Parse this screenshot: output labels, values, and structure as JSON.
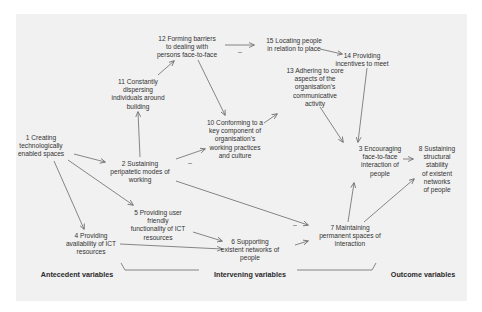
{
  "nodes": {
    "n1": "1 Creating\ntechnologically\nenabled spaces",
    "n2": "2 Sustaining\nperipatetic modes of\nworking",
    "n3": "3 Encouraging\nface-to-face\ninteraction of\npeople",
    "n4": "4 Providing\navailability of ICT\nresources",
    "n5": "5 Providing user\nfriendly\nfunctionality of ICT\nresources",
    "n6": "6 Supporting\nexistent networks of\npeople",
    "n7": "7 Maintaining\npermanent spaces of\ninteraction",
    "n8": "8 Sustaining\nstructural stability\nof existent networks\nof people",
    "n10": "10 Conforming to a\nkey component of\norganisation's\nworking practices\nand culture",
    "n11": "11 Constantly\ndispersing\nindividuals around\nbuilding",
    "n12": "12 Forming barriers\nto dealing with\npersons face-to-face",
    "n13": "13 Adhering to core\naspects of the\norganisation's\ncommunicative\nactivity",
    "n14": "14 Providing\nincentives to meet",
    "n15": "15 Locating people\nin relation to place"
  },
  "axis_labels": {
    "antecedent": "Antecedent variables",
    "intervening": "Intervening variables",
    "outcome": "Outcome variables"
  },
  "signs": {
    "negative": "–"
  },
  "edges": [
    {
      "from": "1",
      "to": "2"
    },
    {
      "from": "1",
      "to": "4"
    },
    {
      "from": "1",
      "to": "5"
    },
    {
      "from": "2",
      "to": "11"
    },
    {
      "from": "2",
      "to": "10",
      "sign": "–"
    },
    {
      "from": "2",
      "to": "7",
      "sign": "–"
    },
    {
      "from": "11",
      "to": "12"
    },
    {
      "from": "12",
      "to": "15",
      "sign": "–"
    },
    {
      "from": "12",
      "to": "10"
    },
    {
      "from": "15",
      "to": "14"
    },
    {
      "from": "10",
      "to": "13"
    },
    {
      "from": "13",
      "to": "3"
    },
    {
      "from": "14",
      "to": "3"
    },
    {
      "from": "3",
      "to": "8"
    },
    {
      "from": "7",
      "to": "3"
    },
    {
      "from": "7",
      "to": "8"
    },
    {
      "from": "5",
      "to": "6"
    },
    {
      "from": "4",
      "to": "6"
    },
    {
      "from": "6",
      "to": "7"
    }
  ],
  "colors": {
    "panel": "#f1f1f1",
    "arrow": "#6a6a6a",
    "text": "#333333"
  }
}
